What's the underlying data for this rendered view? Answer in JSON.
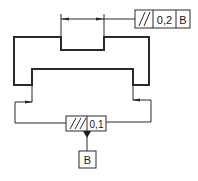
{
  "drawing": {
    "type": "geometric-tolerance-parallelism",
    "top_frame": {
      "symbol": "//",
      "symbol_name": "parallelism",
      "tolerance": "0,2",
      "datum": "B"
    },
    "bottom_frame": {
      "symbol": "//",
      "symbol_name": "parallelism",
      "tolerance": "0,1"
    },
    "datum_label": "B",
    "colors": {
      "line": "#2a2a2a",
      "background": "#ffffff"
    }
  }
}
